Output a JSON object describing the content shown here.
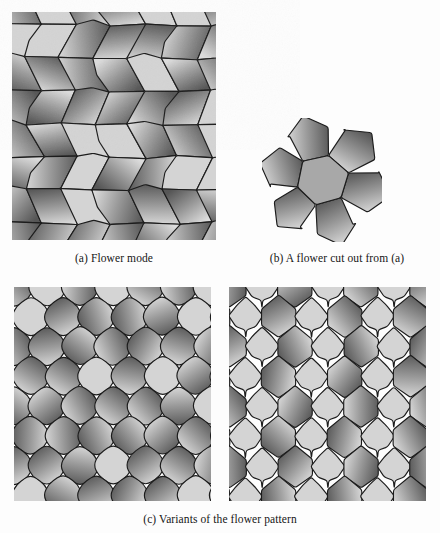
{
  "figure": {
    "background_color": "#fdfdfd",
    "outline_color": "#1c1c1c",
    "light_cell_color": "#d4d4d4",
    "gradient_dark_color": "#565656",
    "gradient_light_color": "#dcdcdc",
    "caption_font_size_px": 11.5
  },
  "panels": [
    {
      "id": "a",
      "name": "flower-mode-tiling",
      "caption": "(a) Flower mode",
      "tiling_type": "pentagon-flower",
      "columns": 6,
      "rows": 7,
      "cell_width": 34,
      "cell_height": 33,
      "jitter": 2.1,
      "corner_radius": 1.5,
      "description": "Irregular pentagon cells tiled in the flower mode; alternating flat light cells and dark-to-light shaded cells."
    },
    {
      "id": "b",
      "name": "single-flower-cutout",
      "caption": "(b) A flower cut out from (a)",
      "tiling_type": "single-flower",
      "petal_count": 6,
      "center_cell_color": "#a8a8a8",
      "center_radius": 26,
      "petal_radius": 44,
      "description": "One flower rosette: a central pentagon ringed by six shaded pentagonal petals."
    },
    {
      "id": "c-left",
      "name": "variant-rounded-tiling",
      "caption": "",
      "tiling_type": "rounded-lobed",
      "columns": 6,
      "rows": 7,
      "cell_width": 33,
      "cell_height": 31,
      "jitter": 1.2,
      "corner_radius": 7,
      "description": "Variant with strongly rounded, lobed cells packed in offset rows."
    },
    {
      "id": "c-right",
      "name": "variant-pointed-hexagon-tiling",
      "caption": "",
      "tiling_type": "pointed-hexagon",
      "columns": 6,
      "rows": 7,
      "cell_width": 33,
      "cell_height": 31,
      "jitter": 0.6,
      "corner_radius": 2,
      "description": "Variant with pointed-top hexagonal cells alternating with notched trefoil cells."
    }
  ],
  "captions": {
    "a": "(a) Flower mode",
    "b": "(b) A flower cut out from (a)",
    "c": "(c) Variants of the flower pattern"
  }
}
